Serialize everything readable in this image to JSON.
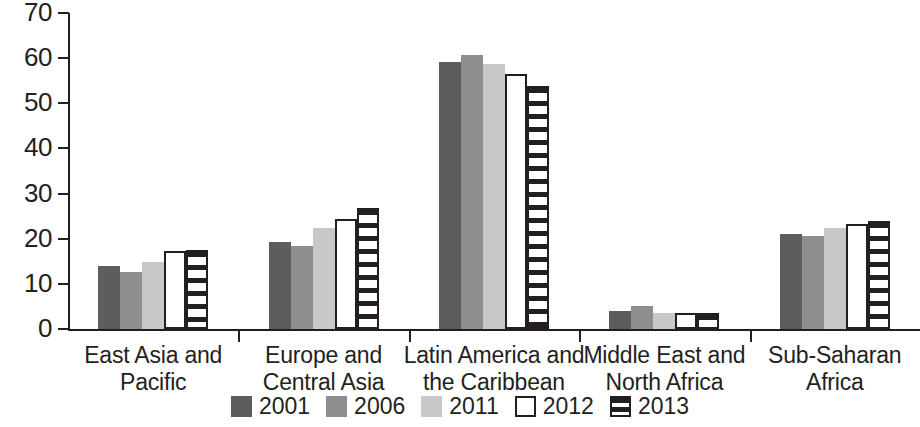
{
  "chart_data": {
    "type": "bar",
    "title": "",
    "subtitle": "",
    "xlabel": "",
    "ylabel": "",
    "ylim": [
      0,
      70
    ],
    "y_ticks": [
      0,
      10,
      20,
      30,
      40,
      50,
      60,
      70
    ],
    "grid": false,
    "legend_position": "bottom",
    "categories": [
      "East Asia and\nPacific",
      "Europe and\nCentral Asia",
      "Latin America and\nthe Caribbean",
      "Middle East and\nNorth Africa",
      "Sub-Saharan\nAfrica"
    ],
    "category_lines": [
      [
        "East Asia and",
        "Pacific"
      ],
      [
        "Europe and",
        "Central Asia"
      ],
      [
        "Latin America and",
        "the Caribbean"
      ],
      [
        "Middle East and",
        "North Africa"
      ],
      [
        "Sub-Saharan",
        "Africa"
      ]
    ],
    "series": [
      {
        "name": "2001",
        "color": "#5d5d5d",
        "style": "solid",
        "values": [
          14.0,
          19.2,
          59.2,
          4.1,
          21.0
        ]
      },
      {
        "name": "2006",
        "color": "#8e8e8e",
        "style": "solid",
        "values": [
          12.7,
          18.5,
          60.6,
          5.0,
          20.7
        ]
      },
      {
        "name": "2011",
        "color": "#c8c8c8",
        "style": "solid",
        "values": [
          14.8,
          22.3,
          58.6,
          3.5,
          22.4
        ]
      },
      {
        "name": "2012",
        "color": "#ffffff",
        "style": "outline",
        "values": [
          17.2,
          24.4,
          56.4,
          3.6,
          23.2
        ]
      },
      {
        "name": "2013",
        "color": "#ffffff",
        "style": "striped",
        "values": [
          17.6,
          26.7,
          53.8,
          3.6,
          23.9
        ]
      }
    ]
  },
  "legend": {
    "items": [
      {
        "label": "2001",
        "swatch": "legend-swatch-2001"
      },
      {
        "label": "2006",
        "swatch": "legend-swatch-2006"
      },
      {
        "label": "2011",
        "swatch": "legend-swatch-2011"
      },
      {
        "label": "2012",
        "swatch": "legend-swatch-2012"
      },
      {
        "label": "2013",
        "swatch": "legend-swatch-2013"
      }
    ]
  }
}
